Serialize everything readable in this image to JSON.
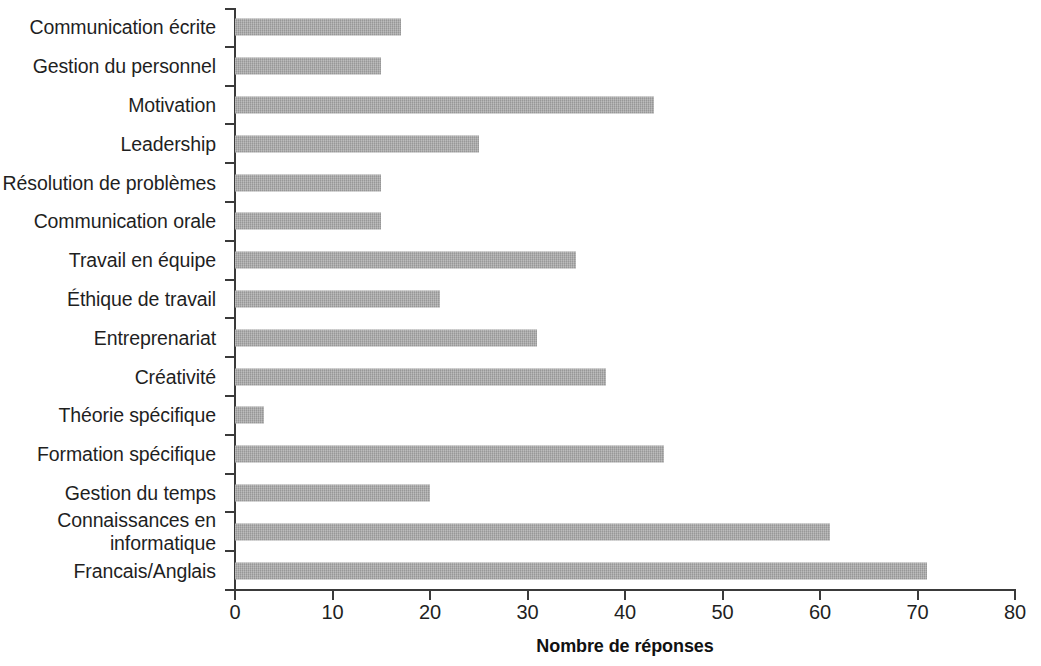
{
  "chart_data": {
    "type": "bar",
    "orientation": "horizontal",
    "title": "",
    "xlabel": "Nombre de réponses",
    "ylabel": "",
    "xlim": [
      0,
      80
    ],
    "xticks": [
      "0",
      "10",
      "20",
      "30",
      "40",
      "50",
      "60",
      "70",
      "80"
    ],
    "grid": false,
    "legend": false,
    "bar_color": "#a6a6a6",
    "axis_color": "#3a3a3a",
    "categories": [
      "Communication écrite",
      "Gestion du personnel",
      "Motivation",
      "Leadership",
      "Résolution de problèmes",
      "Communication orale",
      "Travail en équipe",
      "Éthique de travail",
      "Entreprenariat",
      "Créativité",
      "Théorie spécifique",
      "Formation spécifique",
      "Gestion du temps",
      "Connaissances en\ninformatique",
      "Francais/Anglais"
    ],
    "values": [
      17,
      15,
      43,
      25,
      15,
      15,
      35,
      21,
      31,
      38,
      3,
      44,
      20,
      61,
      71
    ]
  }
}
